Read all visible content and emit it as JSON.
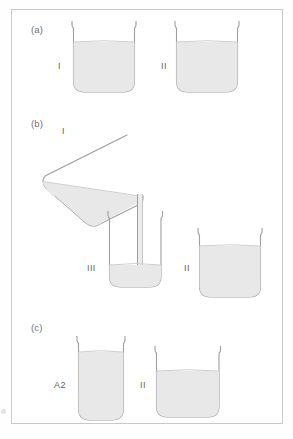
{
  "figure": {
    "background_color": "#ffffff",
    "frame_border_color": "#c9c9c9",
    "outline_color": "#9e9e9e",
    "liquid_color": "#e8e8e8",
    "liquid_edge_color": "#cfcfcf",
    "label_color": "#6f6f6f"
  },
  "panels": [
    {
      "id": "a",
      "label": "(a)",
      "vessels": [
        {
          "name": "beaker-a-left",
          "label": "I",
          "shape": "wide-beaker",
          "fill_percent": 65
        },
        {
          "name": "beaker-a-right",
          "label": "II",
          "shape": "wide-beaker",
          "fill_percent": 65
        }
      ]
    },
    {
      "id": "b",
      "label": "(b)",
      "vessels": [
        {
          "name": "beaker-b-tilted",
          "label": "I",
          "shape": "tilted-beaker-pouring",
          "fill_percent": 45
        },
        {
          "name": "beaker-b-narrow",
          "label": "III",
          "shape": "narrow-beaker",
          "fill_percent": 30
        },
        {
          "name": "beaker-b-receiver",
          "label": "II",
          "shape": "wide-beaker",
          "fill_percent": 70
        }
      ],
      "stream": {
        "name": "pour-stream",
        "visible": true
      }
    },
    {
      "id": "c",
      "label": "(c)",
      "vessels": [
        {
          "name": "beaker-c-tall",
          "label": "A2",
          "shape": "tall-narrow-beaker",
          "fill_percent": 85
        },
        {
          "name": "beaker-c-right",
          "label": "II",
          "shape": "wide-beaker",
          "fill_percent": 62
        }
      ]
    }
  ]
}
